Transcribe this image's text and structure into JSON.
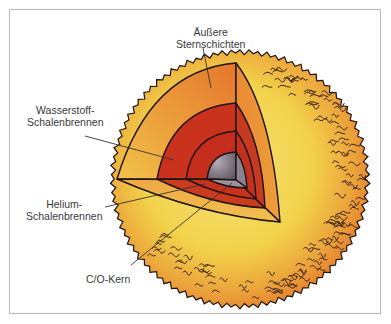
{
  "figure": {
    "labels": {
      "outer_layers": [
        "Äußere",
        "Sternschichten"
      ],
      "hydrogen_shell": [
        "Wasserstoff-",
        "Schalenbrennen"
      ],
      "helium_shell": [
        "Helium-",
        "Schalenbrennen"
      ],
      "core": [
        "C/O-Kern"
      ]
    },
    "colors": {
      "photosphere": "#f2d24a",
      "photosphere_glow": "#e8862e",
      "outer_layer_cut": "#eda23c",
      "hydrogen_shell": "#c9331e",
      "helium_shell": "#c42d1c",
      "core": "#8a8290",
      "outline": "#1e1412",
      "frame": "#b9b9b9",
      "label_text": "#3a3a3a"
    }
  }
}
